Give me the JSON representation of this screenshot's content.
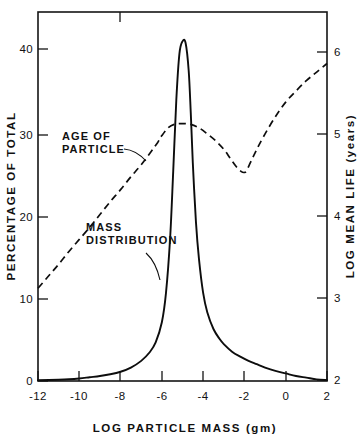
{
  "figure": {
    "background": "#ffffff",
    "ink_color": "#111111"
  },
  "chart_data": {
    "type": "line",
    "title": "",
    "subtitle": "",
    "xlabel": "LOG  PARTICLE  MASS  (gm)",
    "ylabel": "PERCENTAGE  OF  TOTAL",
    "y2label": "LOG   MEAN  LIFE   (years)",
    "xlim": [
      -12,
      2
    ],
    "ylim": [
      0,
      44
    ],
    "y2lim": [
      2,
      6.3
    ],
    "xticks": [
      -12,
      -10,
      -8,
      -6,
      -4,
      -2,
      0,
      2
    ],
    "xticklabels": [
      "-12",
      "-10",
      "-8",
      "-6",
      "-4",
      "-2",
      "0",
      "2"
    ],
    "yticks": [
      0,
      10,
      20,
      30,
      40
    ],
    "yticklabels": [
      "0",
      "10",
      "20",
      "30",
      "40"
    ],
    "y2ticks": [
      2,
      3,
      4,
      5,
      6
    ],
    "y2ticklabels": [
      "2",
      "3",
      "4",
      "5",
      "6"
    ],
    "grid": false,
    "legend": "annotations",
    "series": [
      {
        "name": "MASS DISTRIBUTION",
        "style": "solid",
        "axis": "left",
        "units": "percentage of total",
        "x": [
          -12,
          -11,
          -10.5,
          -10,
          -9.5,
          -9,
          -8.5,
          -8,
          -7.5,
          -7,
          -6.6,
          -6.3,
          -6.0,
          -5.8,
          -5.6,
          -5.45,
          -5.3,
          -5.15,
          -5.0,
          -4.85,
          -4.7,
          -4.6,
          -4.5,
          -4.35,
          -4.2,
          -4.0,
          -3.8,
          -3.5,
          -3.2,
          -3.0,
          -2.6,
          -2.2,
          -1.8,
          -1.4,
          -1.0,
          -0.5,
          0.0,
          0.5,
          1.0,
          1.5,
          2.0
        ],
        "y": [
          0.1,
          0.15,
          0.2,
          0.3,
          0.45,
          0.6,
          0.8,
          1.1,
          1.6,
          2.4,
          3.4,
          4.6,
          7.0,
          10.5,
          17.0,
          25.0,
          33.5,
          39.0,
          40.5,
          40.3,
          37.0,
          32.0,
          26.0,
          19.0,
          14.5,
          10.5,
          8.2,
          6.2,
          5.0,
          4.4,
          3.5,
          2.9,
          2.4,
          2.0,
          1.6,
          1.2,
          0.9,
          0.6,
          0.4,
          0.2,
          0.1
        ]
      },
      {
        "name": "AGE OF PARTICLE",
        "style": "dashed",
        "axis": "right",
        "units": "log mean life (years)",
        "x": [
          -12,
          -11.5,
          -11,
          -10.5,
          -10,
          -9.5,
          -9,
          -8.5,
          -8,
          -7.5,
          -7,
          -6.5,
          -6.2,
          -6.0,
          -5.7,
          -5.4,
          -5.0,
          -4.6,
          -4.2,
          -3.8,
          -3.4,
          -3.0,
          -2.7,
          -2.4,
          -2.15,
          -2.0,
          -1.9,
          -1.7,
          -1.4,
          -1.0,
          -0.5,
          0.0,
          0.5,
          1.0,
          1.5,
          2.0
        ],
        "y": [
          3.08,
          3.22,
          3.36,
          3.51,
          3.65,
          3.79,
          3.94,
          4.09,
          4.23,
          4.38,
          4.52,
          4.68,
          4.78,
          4.86,
          4.95,
          4.99,
          5.0,
          4.99,
          4.95,
          4.88,
          4.8,
          4.7,
          4.6,
          4.5,
          4.44,
          4.43,
          4.45,
          4.55,
          4.7,
          4.88,
          5.08,
          5.25,
          5.38,
          5.5,
          5.6,
          5.7
        ]
      }
    ],
    "annotations": [
      {
        "id": "age-of-particle",
        "lines": [
          "AGE  OF",
          "PARTICLE"
        ],
        "text_x_px": 62,
        "text_y_px": 140,
        "leader_from_px": [
          124,
          148
        ],
        "leader_to_px": [
          145,
          160
        ]
      },
      {
        "id": "mass-distribution",
        "lines": [
          "MASS",
          "DISTRIBUTION"
        ],
        "text_x_px": 86,
        "text_y_px": 231,
        "leader_from_px": [
          147,
          255
        ],
        "leader_to_px": [
          160,
          279
        ]
      }
    ]
  }
}
